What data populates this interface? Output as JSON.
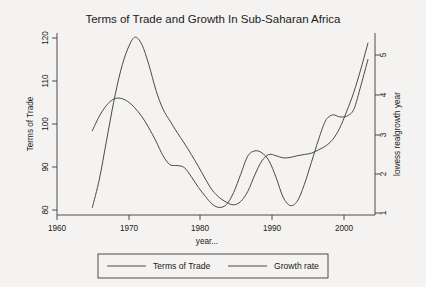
{
  "chart_data": {
    "type": "line",
    "title": "Terms of Trade and Growth In Sub-Saharan Africa",
    "xlabel": "year...",
    "ylabel": "Terms of Trade",
    "y2label": "lowess realgrowth year",
    "xlim": [
      1960,
      2005
    ],
    "ylim": [
      78,
      121
    ],
    "y2lim": [
      0.85,
      5.45
    ],
    "grid": false,
    "legend_position": "bottom-outside",
    "xticks": [
      1960,
      1970,
      1980,
      1990,
      2000
    ],
    "xtick_labels": [
      "1960",
      "1970",
      "1980",
      "1990",
      "2000"
    ],
    "yticks": [
      80,
      90,
      100,
      110,
      120
    ],
    "ytick_labels": [
      "80",
      "90",
      "100",
      "110",
      "120"
    ],
    "y2ticks": [
      1,
      2,
      3,
      4,
      5
    ],
    "y2tick_labels": [
      "1",
      "2",
      "3",
      "4",
      "5"
    ],
    "series": [
      {
        "name": "Terms of Trade",
        "axis": "left",
        "x": [
          1965,
          1966,
          1967,
          1968,
          1969,
          1970,
          1971,
          1972,
          1973,
          1974,
          1975,
          1976,
          1977,
          1978,
          1979,
          1980,
          1981,
          1982,
          1983,
          1984,
          1985,
          1986,
          1987,
          1988,
          1989,
          1990,
          1991,
          1992,
          1993,
          1994,
          1995,
          1996,
          1997,
          1998,
          1999,
          2000,
          2001,
          2002,
          2003,
          2004
        ],
        "values": [
          79.8,
          86.5,
          95.5,
          104.5,
          112.0,
          117.2,
          120.0,
          118.3,
          113.5,
          107.5,
          103.0,
          100.2,
          97.5,
          95.0,
          92.3,
          89.5,
          86.5,
          83.8,
          82.1,
          81.0,
          80.4,
          81.2,
          83.6,
          87.5,
          90.8,
          92.3,
          92.0,
          91.5,
          91.6,
          92.0,
          92.3,
          92.6,
          93.4,
          94.3,
          95.8,
          98.5,
          102.5,
          107.0,
          112.5,
          118.6
        ]
      },
      {
        "name": "Growth rate",
        "axis": "right",
        "x": [
          1965,
          1966,
          1967,
          1968,
          1969,
          1970,
          1971,
          1972,
          1973,
          1974,
          1975,
          1976,
          1977,
          1978,
          1979,
          1980,
          1981,
          1982,
          1983,
          1984,
          1985,
          1986,
          1987,
          1988,
          1989,
          1990,
          1991,
          1992,
          1993,
          1994,
          1995,
          1996,
          1997,
          1998,
          1999,
          2000,
          2001,
          2002,
          2003,
          2004
        ],
        "values": [
          2.98,
          3.35,
          3.62,
          3.78,
          3.8,
          3.72,
          3.56,
          3.34,
          3.05,
          2.72,
          2.35,
          2.12,
          2.1,
          2.05,
          1.82,
          1.55,
          1.32,
          1.12,
          1.04,
          1.12,
          1.42,
          1.88,
          2.34,
          2.47,
          2.42,
          2.22,
          1.8,
          1.3,
          1.09,
          1.2,
          1.62,
          2.18,
          2.75,
          3.23,
          3.38,
          3.33,
          3.35,
          3.52,
          4.12,
          4.78
        ]
      }
    ]
  },
  "legend": {
    "items": [
      {
        "label": "Terms of Trade"
      },
      {
        "label": "Growth rate"
      }
    ]
  }
}
